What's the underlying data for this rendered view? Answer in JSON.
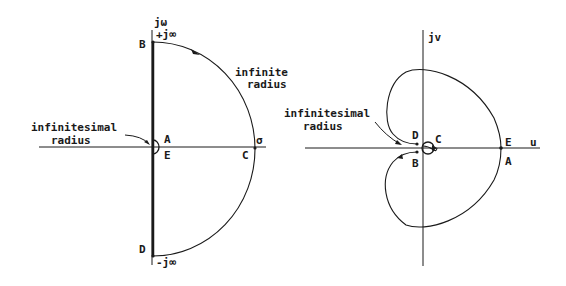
{
  "left_diagram": {
    "title": "s-plane Nyquist contour",
    "axis_vertical_label": "jω",
    "axis_horizontal_label": "σ",
    "top_label": "+j∞",
    "bottom_label": "-j∞",
    "points": {
      "A": "A",
      "B": "B",
      "C": "C",
      "D": "D",
      "E": "E"
    },
    "annotation_infinite": [
      "infinite",
      "radius"
    ],
    "annotation_infinitesimal": [
      "infinitesimal",
      "radius"
    ]
  },
  "right_diagram": {
    "title": "GH-plane Nyquist plot",
    "axis_vertical_label": "jv",
    "axis_horizontal_label": "u",
    "points": {
      "A": "A",
      "B": "B",
      "C": "C",
      "D": "D",
      "E": "E"
    },
    "annotation_infinitesimal": [
      "infinitesimal",
      "radius"
    ]
  },
  "colors": {
    "line": "#1a1a1a",
    "background": "#ffffff"
  }
}
